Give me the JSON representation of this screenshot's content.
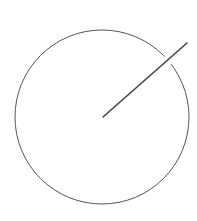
{
  "diagram": {
    "type": "circle-with-radius",
    "circle": {
      "cx": 102,
      "cy": 117,
      "r": 87,
      "stroke": "#555555"
    },
    "radius_line": {
      "x1": 103,
      "y1": 117,
      "x2": 187,
      "y2": 43,
      "stroke": "#444444"
    },
    "gap_mask": {
      "cx": 168,
      "cy": 60,
      "r": 5,
      "fill": "#ffffff"
    }
  }
}
